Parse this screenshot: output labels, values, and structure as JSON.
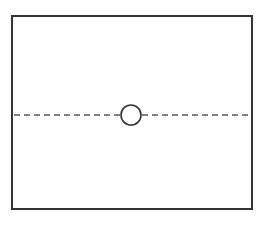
{
  "diagram": {
    "type": "rectangle-with-dashed-centerline-and-circle",
    "stroke_color": "#333333",
    "background": "#ffffff",
    "frame": {
      "x": 12,
      "y": 16,
      "width": 240,
      "height": 193
    },
    "centerline": {
      "y": 115,
      "x1": 14,
      "x2": 250,
      "style": "dashed"
    },
    "circle": {
      "cx": 131,
      "cy": 115,
      "r": 10
    }
  }
}
